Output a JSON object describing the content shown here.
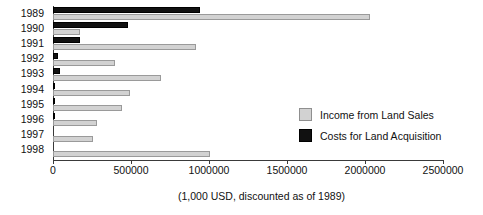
{
  "chart_data": {
    "type": "bar",
    "orientation": "horizontal",
    "title": "",
    "xlabel": "(1,000 USD, discounted as of 1989)",
    "ylabel": "",
    "xlim": [
      0,
      2500000
    ],
    "xticks": [
      0,
      500000,
      1000000,
      1500000,
      2000000,
      2500000
    ],
    "xtick_labels": [
      "0",
      "500000",
      "1000000",
      "1500000",
      "2000000",
      "2500000"
    ],
    "grid": false,
    "legend_position": "center-right",
    "categories": [
      "1989",
      "1990",
      "1991",
      "1992",
      "1993",
      "1994",
      "1995",
      "1996",
      "1997",
      "1998"
    ],
    "series": [
      {
        "name": "Income from Land Sales",
        "color": "#d2d2d2",
        "values": [
          2032000,
          173000,
          917000,
          397000,
          692000,
          493000,
          442000,
          282000,
          256000,
          1006000
        ]
      },
      {
        "name": "Costs for Land Acquisition",
        "color": "#111111",
        "values": [
          942000,
          481000,
          173000,
          32000,
          45000,
          6000,
          5000,
          10000,
          0,
          0
        ]
      }
    ]
  },
  "legend": {
    "items": [
      {
        "label": "Income from Land Sales",
        "swatch": "income-swatch"
      },
      {
        "label": "Costs for Land Acquisition",
        "swatch": "cost-swatch"
      }
    ]
  },
  "caption": {
    "text": "(1,000 USD, discounted as of 1989)"
  }
}
